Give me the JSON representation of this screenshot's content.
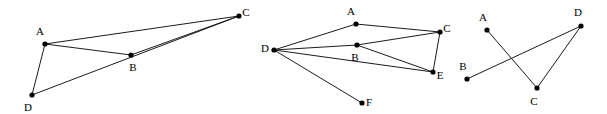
{
  "figure": {
    "background_color": "#ffffff",
    "edge_color": "#1b1b1b",
    "vertex_color": "#000000",
    "label_color": "#000000",
    "width": 607,
    "height": 114
  },
  "graphs": [
    {
      "name": "graph-1",
      "vertices": [
        {
          "id": "A",
          "label": "A",
          "x": 45,
          "y": 44,
          "label_x": 40,
          "label_y": 32
        },
        {
          "id": "B",
          "label": "B",
          "x": 131,
          "y": 55,
          "label_x": 133,
          "label_y": 68
        },
        {
          "id": "C",
          "label": "C",
          "x": 239,
          "y": 16,
          "label_x": 246,
          "label_y": 13
        },
        {
          "id": "D",
          "label": "D",
          "x": 32,
          "y": 95,
          "label_x": 28,
          "label_y": 108
        }
      ],
      "edges": [
        {
          "from": "A",
          "to": "C"
        },
        {
          "from": "A",
          "to": "B"
        },
        {
          "from": "A",
          "to": "D"
        },
        {
          "from": "B",
          "to": "C"
        },
        {
          "from": "D",
          "to": "C"
        }
      ]
    },
    {
      "name": "graph-2",
      "vertices": [
        {
          "id": "A",
          "label": "A",
          "x": 356,
          "y": 24,
          "label_x": 351,
          "label_y": 12
        },
        {
          "id": "B",
          "label": "B",
          "x": 357,
          "y": 45,
          "label_x": 355,
          "label_y": 58
        },
        {
          "id": "C",
          "label": "C",
          "x": 440,
          "y": 32,
          "label_x": 447,
          "label_y": 29
        },
        {
          "id": "D",
          "label": "D",
          "x": 274,
          "y": 50,
          "label_x": 265,
          "label_y": 49
        },
        {
          "id": "E",
          "label": "E",
          "x": 433,
          "y": 72,
          "label_x": 440,
          "label_y": 76
        },
        {
          "id": "F",
          "label": "F",
          "x": 362,
          "y": 103,
          "label_x": 369,
          "label_y": 103
        }
      ],
      "edges": [
        {
          "from": "D",
          "to": "A"
        },
        {
          "from": "D",
          "to": "B"
        },
        {
          "from": "D",
          "to": "E"
        },
        {
          "from": "D",
          "to": "F"
        },
        {
          "from": "A",
          "to": "C"
        },
        {
          "from": "B",
          "to": "C"
        },
        {
          "from": "B",
          "to": "E"
        },
        {
          "from": "C",
          "to": "E"
        }
      ]
    },
    {
      "name": "graph-3",
      "vertices": [
        {
          "id": "A",
          "label": "A",
          "x": 487,
          "y": 30,
          "label_x": 483,
          "label_y": 18
        },
        {
          "id": "B",
          "label": "B",
          "x": 467,
          "y": 79,
          "label_x": 463,
          "label_y": 67
        },
        {
          "id": "C",
          "label": "C",
          "x": 537,
          "y": 88,
          "label_x": 534,
          "label_y": 102
        },
        {
          "id": "D",
          "label": "D",
          "x": 581,
          "y": 26,
          "label_x": 578,
          "label_y": 13
        }
      ],
      "edges": [
        {
          "from": "A",
          "to": "C"
        },
        {
          "from": "B",
          "to": "D"
        },
        {
          "from": "C",
          "to": "D"
        }
      ]
    }
  ]
}
